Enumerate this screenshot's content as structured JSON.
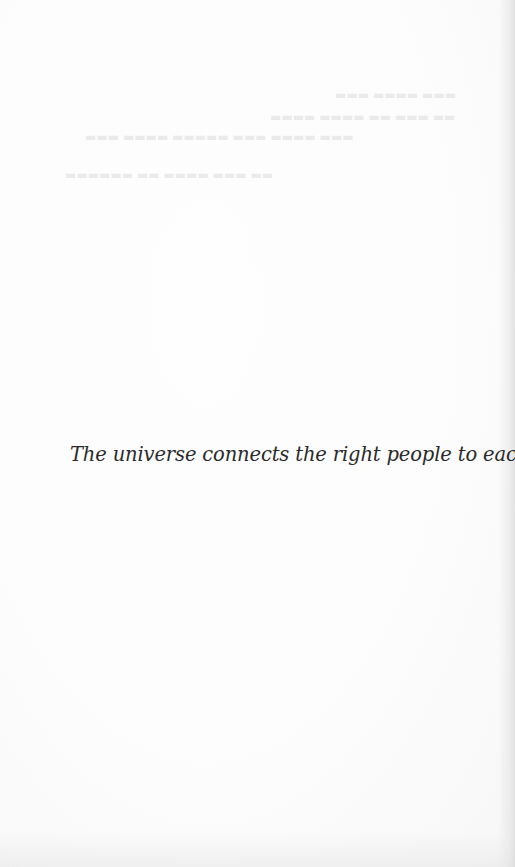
{
  "page": {
    "quote": "The universe connects the right people to each other.",
    "colors": {
      "background": "#fcfcfc",
      "text": "#2a2a2a"
    }
  }
}
